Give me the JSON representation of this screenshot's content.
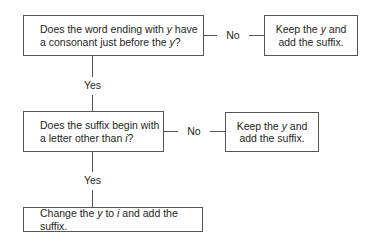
{
  "flowchart": {
    "question1": {
      "line1_pre": "Does the word ending with ",
      "line1_italic": "y",
      "line1_post": " have",
      "line2_pre": "a consonant just before the ",
      "line2_italic": "y",
      "line2_post": "?"
    },
    "answer1_no": {
      "line1_pre": "Keep the ",
      "line1_italic": "y",
      "line1_post": " and",
      "line2": "add the suffix."
    },
    "question2": {
      "line1": "Does the suffix begin with",
      "line2_pre": "a letter other than ",
      "line2_italic": "i",
      "line2_post": "?"
    },
    "answer2_no": {
      "line1_pre": "Keep the ",
      "line1_italic": "y",
      "line1_post": " and",
      "line2": "add the suffix."
    },
    "answer_final": {
      "pre": "Change the ",
      "italic1": "y",
      "mid": " to ",
      "italic2": "i",
      "post": " and add the suffix."
    },
    "labels": {
      "no1": "No",
      "yes1": "Yes",
      "no2": "No",
      "yes2": "Yes"
    }
  }
}
